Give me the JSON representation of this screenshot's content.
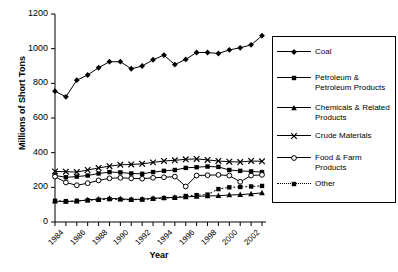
{
  "chart_data": {
    "type": "line",
    "title": "",
    "xlabel": "Year",
    "ylabel": "Millions of Short Tons",
    "xlim": [
      1984,
      2003
    ],
    "ylim": [
      0,
      1200
    ],
    "yticks": [
      0,
      200,
      400,
      600,
      800,
      1000,
      1200
    ],
    "xticks": [
      1984,
      1986,
      1988,
      1990,
      1992,
      1994,
      1996,
      1998,
      2000,
      2002
    ],
    "x": [
      1984,
      1985,
      1986,
      1987,
      1988,
      1989,
      1990,
      1991,
      1992,
      1993,
      1994,
      1995,
      1996,
      1997,
      1998,
      1999,
      2000,
      2001,
      2002,
      2003
    ],
    "grid": false,
    "legend_position": "right",
    "series": [
      {
        "name": "Coal",
        "marker": "diamond",
        "line": "solid",
        "values": [
          755,
          722,
          818,
          848,
          890,
          925,
          925,
          884,
          900,
          936,
          963,
          908,
          938,
          978,
          978,
          972,
          993,
          1005,
          1022,
          1075
        ]
      },
      {
        "name": "Petroleum & Petroleum Products",
        "marker": "square",
        "line": "solid",
        "values": [
          268,
          258,
          262,
          268,
          280,
          288,
          286,
          280,
          278,
          288,
          295,
          300,
          312,
          316,
          320,
          318,
          300,
          295,
          292,
          288
        ]
      },
      {
        "name": "Chemicals & Related Products",
        "marker": "triangle",
        "line": "solid",
        "values": [
          120,
          118,
          120,
          128,
          132,
          136,
          134,
          130,
          132,
          136,
          140,
          142,
          144,
          148,
          150,
          152,
          156,
          158,
          162,
          168
        ]
      },
      {
        "name": "Crude Materials",
        "marker": "x",
        "line": "solid",
        "values": [
          292,
          290,
          288,
          300,
          312,
          322,
          330,
          332,
          336,
          344,
          352,
          356,
          362,
          364,
          358,
          352,
          348,
          346,
          352,
          350
        ]
      },
      {
        "name": "Food & Farm Products",
        "marker": "circle-open",
        "line": "solid",
        "values": [
          262,
          228,
          212,
          224,
          240,
          252,
          255,
          252,
          250,
          255,
          258,
          262,
          205,
          268,
          270,
          272,
          268,
          232,
          268,
          272
        ]
      },
      {
        "name": "Other",
        "marker": "square",
        "line": "dotted",
        "values": [
          122,
          120,
          122,
          125,
          128,
          132,
          130,
          128,
          130,
          134,
          138,
          140,
          150,
          155,
          158,
          190,
          200,
          202,
          205,
          208
        ]
      }
    ]
  },
  "axes": {
    "ylabel": "Millions of Short Tons",
    "xlabel": "Year",
    "yticks": [
      "1200",
      "1000",
      "800",
      "600",
      "400",
      "200",
      "0"
    ],
    "xticks": [
      "1984",
      "1986",
      "1988",
      "1990",
      "1992",
      "1994",
      "1996",
      "1998",
      "2000",
      "2002"
    ]
  },
  "legend": {
    "items": [
      {
        "label": "Coal",
        "marker": "diamond-icon",
        "line": "solid"
      },
      {
        "label": "Petroleum & Petroleum Products",
        "marker": "square-icon",
        "line": "solid"
      },
      {
        "label": "Chemicals & Related Products",
        "marker": "triangle-icon",
        "line": "solid"
      },
      {
        "label": "Crude Materials",
        "marker": "x-icon",
        "line": "solid"
      },
      {
        "label": "Food & Farm Products",
        "marker": "circle-open-icon",
        "line": "solid"
      },
      {
        "label": "Other",
        "marker": "square-icon",
        "line": "dotted"
      }
    ]
  },
  "colors": {
    "series": "#000000",
    "axis": "#000000",
    "background": "#ffffff"
  }
}
